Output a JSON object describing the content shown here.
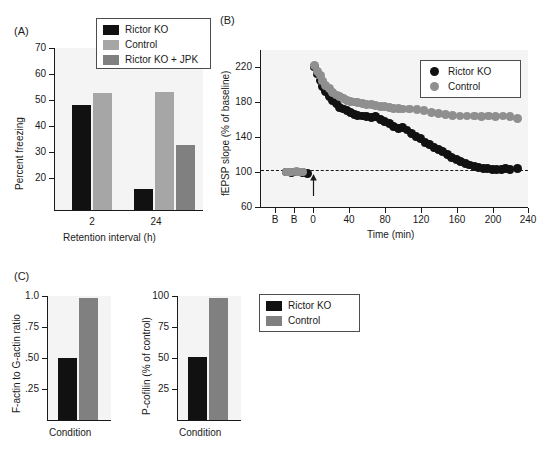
{
  "figure": {
    "panels": [
      "(A)",
      "(B)",
      "(C)"
    ]
  },
  "panelA": {
    "label": "(A)",
    "legend": [
      {
        "name": "Rictor KO",
        "color": "#111111"
      },
      {
        "name": "Control",
        "color": "#a6a6a6"
      },
      {
        "name": "Rictor KO + JPK",
        "color": "#808080"
      }
    ],
    "ylabel": "Percent freezing",
    "xlabel": "Retention interval (h)",
    "yticks": [
      "70",
      "60",
      "50",
      "40",
      "30",
      "20"
    ],
    "xticks": [
      "2",
      "24"
    ]
  },
  "panelB": {
    "label": "(B)",
    "legend": [
      {
        "name": "Rictor KO",
        "color": "#111111"
      },
      {
        "name": "Control",
        "color": "#8f8f8f"
      }
    ],
    "ylabel": "fEPSP slope (% of baseline)",
    "xlabel": "Time (min)",
    "yticks": [
      "220",
      "180",
      "140",
      "100",
      "60"
    ],
    "xticks": [
      "B",
      "B",
      "0",
      "40",
      "80",
      "120",
      "160",
      "200",
      "240"
    ],
    "baseline_label": "100"
  },
  "panelC": {
    "label": "(C)",
    "legend": [
      {
        "name": "Rictor KO",
        "color": "#111111"
      },
      {
        "name": "Control",
        "color": "#808080"
      }
    ],
    "left": {
      "ylabel": "F-actin to G-actin ratio",
      "xlabel": "Condition",
      "yticks": [
        "1.0",
        ".75",
        ".50",
        ".25"
      ]
    },
    "right": {
      "ylabel": "P-cofilin (% of control)",
      "xlabel": "Condition",
      "yticks": [
        "100",
        "75",
        "50",
        "25"
      ]
    }
  },
  "chart_data": [
    {
      "id": "panel-a",
      "type": "bar",
      "title": "(A) Percent freezing by retention interval",
      "xlabel": "Retention interval (h)",
      "ylabel": "Percent freezing",
      "categories": [
        "2",
        "24"
      ],
      "ylim": [
        13,
        70
      ],
      "yticks": [
        20,
        30,
        40,
        50,
        60,
        70
      ],
      "grid": false,
      "legend_position": "top-center",
      "series": [
        {
          "name": "Rictor KO",
          "color": "#111111",
          "values": [
            51.8,
            17.5
          ]
        },
        {
          "name": "Control",
          "color": "#a6a6a6",
          "values": [
            56.3,
            57.0
          ]
        },
        {
          "name": "Rictor KO + JPK",
          "color": "#808080",
          "values": [
            null,
            33.3
          ]
        }
      ]
    },
    {
      "id": "panel-b",
      "type": "scatter",
      "title": "(B) fEPSP slope over time",
      "xlabel": "Time (min)",
      "ylabel": "fEPSP slope (% of baseline)",
      "ylim": [
        60,
        240
      ],
      "yticks": [
        60,
        100,
        140,
        180,
        220
      ],
      "xlim": [
        -35,
        250
      ],
      "xticks": [
        0,
        40,
        80,
        120,
        160,
        200,
        240
      ],
      "extra_xticks": [
        {
          "label": "B",
          "x": -28
        },
        {
          "label": "B",
          "x": -16
        }
      ],
      "grid": false,
      "legend_position": "top-right",
      "annotations": [
        {
          "type": "dashed-hline",
          "y": 102,
          "note": "baseline 100%"
        },
        {
          "type": "arrow",
          "x": 0,
          "note": "tetanus / stimulation"
        }
      ],
      "series": [
        {
          "name": "Rictor KO",
          "color": "#111111",
          "points": [
            [
              -30,
              100
            ],
            [
              -27,
              100
            ],
            [
              -24,
              99
            ],
            [
              -18,
              100
            ],
            [
              -15,
              100
            ],
            [
              -12,
              99
            ],
            [
              -6,
              98
            ],
            [
              2,
              220
            ],
            [
              5,
              212
            ],
            [
              8,
              205
            ],
            [
              11,
              198
            ],
            [
              14,
              192
            ],
            [
              18,
              186
            ],
            [
              22,
              182
            ],
            [
              26,
              178
            ],
            [
              30,
              174
            ],
            [
              34,
              172
            ],
            [
              38,
              170
            ],
            [
              42,
              168
            ],
            [
              46,
              166
            ],
            [
              50,
              165
            ],
            [
              55,
              164
            ],
            [
              60,
              163
            ],
            [
              65,
              162
            ],
            [
              70,
              163
            ],
            [
              75,
              160
            ],
            [
              80,
              158
            ],
            [
              85,
              155
            ],
            [
              90,
              152
            ],
            [
              95,
              150
            ],
            [
              100,
              151
            ],
            [
              105,
              148
            ],
            [
              110,
              144
            ],
            [
              115,
              141
            ],
            [
              120,
              138
            ],
            [
              125,
              134
            ],
            [
              130,
              131
            ],
            [
              135,
              128
            ],
            [
              140,
              126
            ],
            [
              145,
              123
            ],
            [
              150,
              120
            ],
            [
              155,
              117
            ],
            [
              160,
              114
            ],
            [
              165,
              112
            ],
            [
              170,
              110
            ],
            [
              175,
              108
            ],
            [
              180,
              106
            ],
            [
              185,
              105
            ],
            [
              190,
              104
            ],
            [
              195,
              104
            ],
            [
              200,
              103
            ],
            [
              205,
              103
            ],
            [
              210,
              103
            ],
            [
              215,
              104
            ],
            [
              220,
              103
            ],
            [
              228,
              104
            ]
          ]
        },
        {
          "name": "Control",
          "color": "#8f8f8f",
          "points": [
            [
              -30,
              100
            ],
            [
              -27,
              100
            ],
            [
              -24,
              100
            ],
            [
              -18,
              101
            ],
            [
              -15,
              100
            ],
            [
              -12,
              100
            ],
            [
              2,
              222
            ],
            [
              5,
              215
            ],
            [
              8,
              210
            ],
            [
              11,
              204
            ],
            [
              14,
              199
            ],
            [
              18,
              195
            ],
            [
              22,
              191
            ],
            [
              26,
              188
            ],
            [
              30,
              186
            ],
            [
              34,
              184
            ],
            [
              38,
              182
            ],
            [
              42,
              181
            ],
            [
              46,
              180
            ],
            [
              50,
              179
            ],
            [
              55,
              178
            ],
            [
              60,
              177
            ],
            [
              65,
              177
            ],
            [
              70,
              176
            ],
            [
              75,
              175
            ],
            [
              80,
              175
            ],
            [
              85,
              174
            ],
            [
              90,
              173
            ],
            [
              95,
              173
            ],
            [
              100,
              172
            ],
            [
              108,
              172
            ],
            [
              116,
              171
            ],
            [
              124,
              170
            ],
            [
              132,
              168
            ],
            [
              140,
              167
            ],
            [
              148,
              166
            ],
            [
              156,
              165
            ],
            [
              164,
              164
            ],
            [
              172,
              164
            ],
            [
              180,
              164
            ],
            [
              188,
              163
            ],
            [
              196,
              164
            ],
            [
              204,
              163
            ],
            [
              212,
              164
            ],
            [
              220,
              163
            ],
            [
              228,
              161
            ]
          ]
        }
      ]
    },
    {
      "id": "panel-c-left",
      "type": "bar",
      "title": "(C) F-actin to G-actin ratio",
      "xlabel": "Condition",
      "ylabel": "F-actin to G-actin ratio",
      "categories": [
        "Condition"
      ],
      "ylim": [
        0,
        1.0
      ],
      "yticks": [
        0.25,
        0.5,
        0.75,
        1.0
      ],
      "ytick_labels": [
        ".25",
        ".50",
        ".75",
        "1.0"
      ],
      "grid": false,
      "series": [
        {
          "name": "Rictor KO",
          "color": "#111111",
          "values": [
            0.5
          ]
        },
        {
          "name": "Control",
          "color": "#808080",
          "values": [
            0.985
          ]
        }
      ]
    },
    {
      "id": "panel-c-right",
      "type": "bar",
      "title": "(C) P-cofilin (% of control)",
      "xlabel": "Condition",
      "ylabel": "P-cofilin (% of control)",
      "categories": [
        "Condition"
      ],
      "ylim": [
        0,
        100
      ],
      "yticks": [
        25,
        50,
        75,
        100
      ],
      "grid": false,
      "legend_position": "right",
      "series": [
        {
          "name": "Rictor KO",
          "color": "#111111",
          "values": [
            50.5
          ]
        },
        {
          "name": "Control",
          "color": "#808080",
          "values": [
            98.5
          ]
        }
      ]
    }
  ]
}
